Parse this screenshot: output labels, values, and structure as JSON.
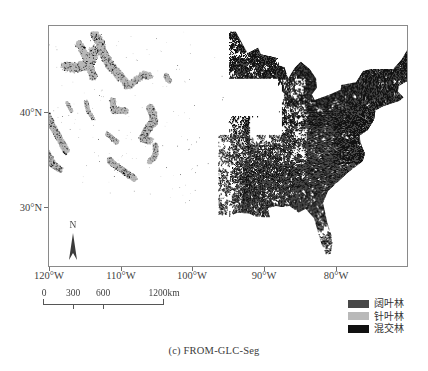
{
  "figure": {
    "caption": "(c) FROM-GLC-Seg",
    "type": "thematic-raster-map",
    "region": "Contiguous United States"
  },
  "axes": {
    "x_ticks": [
      {
        "label": "120°W",
        "value": -120,
        "x": 49
      },
      {
        "label": "110°W",
        "value": -110,
        "x": 121
      },
      {
        "label": "100°W",
        "value": -100,
        "x": 192
      },
      {
        "label": "90°W",
        "value": -90,
        "x": 264
      },
      {
        "label": "80°W",
        "value": -80,
        "x": 336
      }
    ],
    "y_ticks": [
      {
        "label": "40°N",
        "value": 40,
        "y": 112
      },
      {
        "label": "30°N",
        "value": 30,
        "y": 207
      }
    ],
    "x_range": [
      -120.7,
      -69.5
    ],
    "y_range": [
      24.0,
      49.6
    ]
  },
  "north_arrow": {
    "label": "N"
  },
  "scale_bar": {
    "unit": "km",
    "ticks": [
      {
        "label": "0",
        "value": 0,
        "x": 3
      },
      {
        "label": "300",
        "value": 300,
        "x": 33
      },
      {
        "label": "600",
        "value": 600,
        "x": 63
      },
      {
        "label": "1200km",
        "value": 1200,
        "x": 123
      }
    ]
  },
  "legend": {
    "items": [
      {
        "label": "阔叶林",
        "color": "#474747",
        "english": "Broadleaf forest"
      },
      {
        "label": "针叶林",
        "color": "#b9b9b9",
        "english": "Needleleaf forest"
      },
      {
        "label": "混交林",
        "color": "#111111",
        "english": "Mixed forest"
      }
    ]
  },
  "chart_data": {
    "type": "heatmap",
    "title": "(c) FROM-GLC-Seg",
    "xlabel": "",
    "ylabel": "",
    "xlim": [
      -120.7,
      -69.5
    ],
    "ylim": [
      24.0,
      49.6
    ],
    "xtick_labels": [
      "120°W",
      "110°W",
      "100°W",
      "90°W",
      "80°W"
    ],
    "xtick_values": [
      -120,
      -110,
      -100,
      -90,
      -80
    ],
    "ytick_labels": [
      "40°N",
      "30°N"
    ],
    "ytick_values": [
      40,
      30
    ],
    "grid": false,
    "legend_position": "below-right",
    "categories": [
      "阔叶林",
      "针叶林",
      "混交林"
    ],
    "category_colors": [
      "#474747",
      "#b9b9b9",
      "#111111"
    ],
    "background": "#ffffff",
    "region_density": [
      {
        "region": "Pacific Northwest / Cascades",
        "bbox": [
          -124,
          42,
          -120,
          49
        ],
        "dominant": "针叶林",
        "coverage": 0.62
      },
      {
        "region": "Sierra Nevada",
        "bbox": [
          -121,
          36,
          -118,
          40
        ],
        "dominant": "针叶林",
        "coverage": 0.45
      },
      {
        "region": "Northern Rockies",
        "bbox": [
          -116,
          44,
          -110,
          49
        ],
        "dominant": "针叶林",
        "coverage": 0.55
      },
      {
        "region": "Southern Rockies",
        "bbox": [
          -110,
          35,
          -105,
          42
        ],
        "dominant": "针叶林",
        "coverage": 0.33
      },
      {
        "region": "Great Plains",
        "bbox": [
          -104,
          30,
          -96,
          49
        ],
        "dominant": "none",
        "coverage": 0.04
      },
      {
        "region": "Upper Midwest / Great Lakes",
        "bbox": [
          -95,
          42,
          -83,
          49
        ],
        "dominant": "混交林",
        "coverage": 0.68
      },
      {
        "region": "Appalachians / Northeast",
        "bbox": [
          -83,
          36,
          -68,
          47
        ],
        "dominant": "混交林",
        "coverage": 0.82
      },
      {
        "region": "Southeast Coastal Plain",
        "bbox": [
          -92,
          25,
          -76,
          36
        ],
        "dominant": "阔叶林",
        "coverage": 0.74
      },
      {
        "region": "Florida Peninsula",
        "bbox": [
          -83,
          25,
          -80,
          30
        ],
        "dominant": "阔叶林",
        "coverage": 0.48
      }
    ]
  }
}
